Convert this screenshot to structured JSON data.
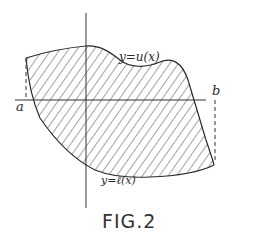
{
  "figure": {
    "caption": "FIG.2",
    "labels": {
      "a": "a",
      "b": "b",
      "upper_curve": "y=u(x)",
      "lower_curve": "y=ℓ(x)"
    },
    "colors": {
      "ink": "#2a2a2a",
      "background": "#ffffff"
    }
  }
}
